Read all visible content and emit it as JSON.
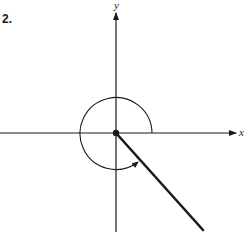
{
  "problem": {
    "number": "2."
  },
  "axes": {
    "x_label": "x",
    "y_label": "y"
  },
  "figure": {
    "type": "angle-in-standard-position",
    "origin": [
      116,
      133
    ],
    "rotation_arc": {
      "direction": "counterclockwise",
      "start": "positive x-axis",
      "ends_at": "terminal side in quadrant IV",
      "radius_px": 36
    },
    "terminal_side": {
      "quadrant": "IV",
      "end_point_px": [
        203,
        230
      ]
    },
    "colors": {
      "ink": "#1a1a1a",
      "background": "#ffffff"
    }
  }
}
